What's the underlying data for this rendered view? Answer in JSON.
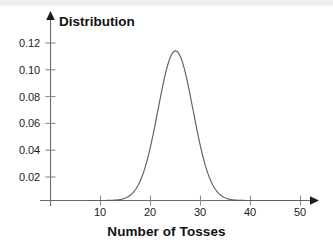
{
  "chart_data": {
    "type": "line",
    "title": "",
    "ylabel": "Distribution",
    "xlabel": "Number of Tosses",
    "xlim": [
      0,
      52
    ],
    "ylim": [
      0,
      0.131
    ],
    "grid": false,
    "legend": null,
    "x_ticks": [
      "10",
      "20",
      "30",
      "40",
      "50"
    ],
    "x_tick_values": [
      10,
      20,
      30,
      40,
      50
    ],
    "y_ticks": [
      "0.02",
      "0.04",
      "0.06",
      "0.08",
      "0.10",
      "0.12"
    ],
    "y_tick_values": [
      0.02,
      0.04,
      0.06,
      0.08,
      0.1,
      0.12
    ],
    "series": [
      {
        "name": "Distribution",
        "description": "bell-shaped normal curve, mean 25, standard deviation 3.5, peak 0.114",
        "mean": 25,
        "stddev": 3.5,
        "peak_value": 0.114,
        "peak_x": 25,
        "x": [
          8,
          10,
          12,
          13,
          14,
          15,
          16,
          17,
          18,
          19,
          20,
          21,
          22,
          23,
          24,
          25,
          26,
          27,
          28,
          29,
          30,
          31,
          32,
          33,
          34,
          35,
          36,
          37,
          38,
          40,
          45,
          50
        ],
        "values": [
          0.0,
          0.0,
          0.0003,
          0.0008,
          0.002,
          0.0042,
          0.0081,
          0.0142,
          0.0228,
          0.0337,
          0.0463,
          0.0589,
          0.0833,
          0.0962,
          0.1093,
          0.114,
          0.1093,
          0.0962,
          0.0833,
          0.0589,
          0.0463,
          0.0337,
          0.0228,
          0.0142,
          0.0081,
          0.0042,
          0.002,
          0.0008,
          0.0003,
          0.0,
          0.0,
          0.0
        ]
      }
    ],
    "colors": {
      "curve": "#5f5f5f",
      "axis": "#6b6b6b",
      "text": "#111111",
      "background": "#ffffff"
    }
  }
}
